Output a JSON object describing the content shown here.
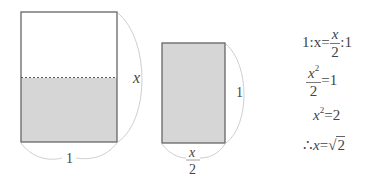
{
  "diagram": {
    "rect_large": {
      "width_label": "1",
      "height_label": "x",
      "fill_top": "#ffffff",
      "fill_bottom": "#d6d6d6",
      "stroke": "#666666",
      "divider": "dashed"
    },
    "rect_small": {
      "width_label_num": "x",
      "width_label_den": "2",
      "height_label": "1",
      "fill": "#d6d6d6",
      "stroke": "#666666"
    }
  },
  "equations": [
    {
      "lhs": "1:x",
      "eq": "=",
      "rhs_num": "x",
      "rhs_den": "2",
      "rhs_tail": ":1"
    },
    {
      "lhs_num": "x",
      "lhs_sup": "2",
      "lhs_den": "2",
      "eq": "=",
      "rhs": "1"
    },
    {
      "lhs": "x",
      "lhs_sup": "2",
      "eq": "=",
      "rhs": "2"
    },
    {
      "prefix": "∴",
      "lhs": "x",
      "eq": "=",
      "radical": "√",
      "radicand": "2"
    }
  ]
}
